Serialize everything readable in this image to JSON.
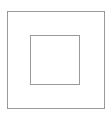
{
  "diagram": {
    "shapes": [
      {
        "name": "outer-square",
        "stroke": "#9a9a9a",
        "fill": "#ffffff"
      },
      {
        "name": "inner-square",
        "stroke": "#9a9a9a",
        "fill": "#ffffff"
      }
    ]
  }
}
